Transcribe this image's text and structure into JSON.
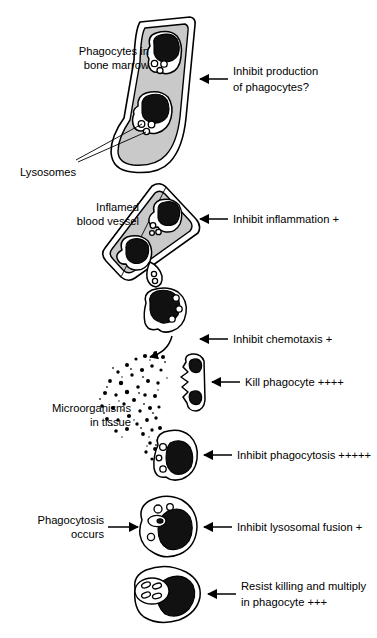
{
  "figure": {
    "background_color": "#ffffff",
    "ink_color": "#000000",
    "fill_gray": "#c9c9c9",
    "nucleus_color": "#111111"
  },
  "left_labels": [
    {
      "id": "phagocytes-bone-marrow",
      "line1": "Phagocytes in",
      "line2": "bone marrow"
    },
    {
      "id": "lysosomes",
      "line1": "Lysosomes",
      "line2": ""
    },
    {
      "id": "inflamed-blood-vessel",
      "line1": "Inflamed",
      "line2": "blood vessel"
    },
    {
      "id": "microorganisms-in-tissue",
      "line1": "Microorganisms",
      "line2": "in tissue"
    },
    {
      "id": "phagocytosis-occurs",
      "line1": "Phagocytosis",
      "line2": "occurs"
    }
  ],
  "right_annotations": [
    {
      "id": "inhibit-production",
      "line1": "Inhibit production",
      "line2": "of phagocytes?",
      "plus": ""
    },
    {
      "id": "inhibit-inflammation",
      "line1": "Inhibit inflammation +",
      "line2": "",
      "plus": "+"
    },
    {
      "id": "inhibit-chemotaxis",
      "line1": "Inhibit chemotaxis +",
      "line2": "",
      "plus": "+"
    },
    {
      "id": "kill-phagocyte",
      "line1": "Kill phagocyte ++++",
      "line2": "",
      "plus": "++++"
    },
    {
      "id": "inhibit-phagocytosis",
      "line1": "Inhibit phagocytosis +++++",
      "line2": "",
      "plus": "+++++"
    },
    {
      "id": "inhibit-lysosomal-fusion",
      "line1": "Inhibit lysosomal fusion +",
      "line2": "",
      "plus": "+"
    },
    {
      "id": "resist-killing",
      "line1": "Resist killing and multiply",
      "line2": "in phagocyte +++",
      "plus": "+++"
    }
  ],
  "stages": [
    {
      "id": "bone-marrow",
      "name": "Bone marrow shaft with two phagocytes"
    },
    {
      "id": "blood-vessel",
      "name": "Inflamed blood vessel with two phagocytes"
    },
    {
      "id": "migrating-phagocyte",
      "name": "Phagocyte migrating toward tissue"
    },
    {
      "id": "damaged-phagocyte",
      "name": "Phagocyte being killed"
    },
    {
      "id": "phagocyte-contacting-microbes",
      "name": "Phagocyte contacting microorganisms"
    },
    {
      "id": "phagocytosing-cell",
      "name": "Phagocyte after ingestion with lysosome fusion"
    },
    {
      "id": "infected-cell",
      "name": "Phagocyte with multiplying microorganisms"
    }
  ]
}
